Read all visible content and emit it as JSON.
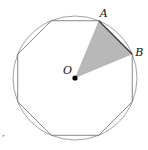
{
  "diagram": {
    "type": "regular polygon inscribed in circle",
    "sides": 8,
    "labels": {
      "center": "O",
      "vertex_a": "A",
      "vertex_b": "B"
    },
    "shaded_region": "triangle OAB",
    "colors": {
      "stroke": "#8a8a8a",
      "shade": "#b8b8b8",
      "center_dot": "#000000"
    },
    "stray_mark": "’"
  }
}
